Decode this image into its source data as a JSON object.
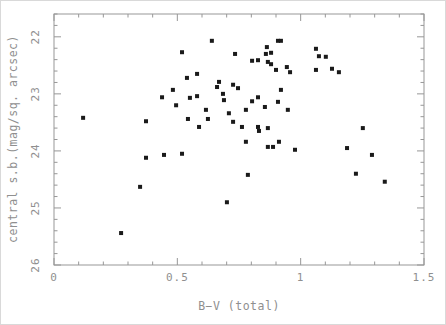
{
  "chart_data": {
    "type": "scatter",
    "title": "",
    "xlabel": "B−V (total)",
    "ylabel": "central s.b.(mag/sq. arcsec)",
    "xlim": [
      0,
      1.5
    ],
    "ylim": [
      21.6,
      26
    ],
    "y_inverted": true,
    "x_major_ticks": [
      0,
      0.5,
      1,
      1.5
    ],
    "x_tick_labels": [
      "0",
      "0.5",
      "1",
      "1.5"
    ],
    "x_minor_step": 0.1,
    "y_major_ticks": [
      22,
      23,
      24,
      25,
      26
    ],
    "y_tick_labels": [
      "22",
      "23",
      "24",
      "25",
      "26"
    ],
    "y_minor_step": 0.2,
    "grid": false,
    "legend": null,
    "marker": "filled-square",
    "marker_color": "#1a1a1a",
    "axis_color": "#979797",
    "label_color": "#8f8f8f",
    "points": [
      [
        0.64,
        22.07
      ],
      [
        0.519,
        22.27
      ],
      [
        0.734,
        22.3
      ],
      [
        0.58,
        22.65
      ],
      [
        0.539,
        22.72
      ],
      [
        0.669,
        22.79
      ],
      [
        0.726,
        22.84
      ],
      [
        0.661,
        22.88
      ],
      [
        0.746,
        22.9
      ],
      [
        0.685,
        23.0
      ],
      [
        0.438,
        23.06
      ],
      [
        0.482,
        22.93
      ],
      [
        0.551,
        23.07
      ],
      [
        0.58,
        23.04
      ],
      [
        0.495,
        23.2
      ],
      [
        0.689,
        23.11
      ],
      [
        0.616,
        23.28
      ],
      [
        0.118,
        23.42
      ],
      [
        0.373,
        23.48
      ],
      [
        0.624,
        23.44
      ],
      [
        0.543,
        23.44
      ],
      [
        0.709,
        23.34
      ],
      [
        0.588,
        23.58
      ],
      [
        0.726,
        23.49
      ],
      [
        0.373,
        24.12
      ],
      [
        0.446,
        24.07
      ],
      [
        0.519,
        24.05
      ],
      [
        0.349,
        24.63
      ],
      [
        0.701,
        24.9
      ],
      [
        0.272,
        25.44
      ],
      [
        0.908,
        22.07
      ],
      [
        0.92,
        22.07
      ],
      [
        0.863,
        22.18
      ],
      [
        0.859,
        22.3
      ],
      [
        0.88,
        22.28
      ],
      [
        0.803,
        22.42
      ],
      [
        0.827,
        22.41
      ],
      [
        0.867,
        22.44
      ],
      [
        0.88,
        22.48
      ],
      [
        0.9,
        22.58
      ],
      [
        0.944,
        22.53
      ],
      [
        0.957,
        22.62
      ],
      [
        1.062,
        22.21
      ],
      [
        1.074,
        22.34
      ],
      [
        1.102,
        22.35
      ],
      [
        1.062,
        22.58
      ],
      [
        1.127,
        22.56
      ],
      [
        1.155,
        22.62
      ],
      [
        0.92,
        22.93
      ],
      [
        0.803,
        23.13
      ],
      [
        0.827,
        23.06
      ],
      [
        0.778,
        23.28
      ],
      [
        0.855,
        23.23
      ],
      [
        0.908,
        23.14
      ],
      [
        0.948,
        23.28
      ],
      [
        0.762,
        23.58
      ],
      [
        0.827,
        23.58
      ],
      [
        0.831,
        23.65
      ],
      [
        0.867,
        23.6
      ],
      [
        0.778,
        23.84
      ],
      [
        0.912,
        23.84
      ],
      [
        0.867,
        23.93
      ],
      [
        0.888,
        23.93
      ],
      [
        0.977,
        23.98
      ],
      [
        1.252,
        23.6
      ],
      [
        1.188,
        23.95
      ],
      [
        1.289,
        24.07
      ],
      [
        0.786,
        24.42
      ],
      [
        1.224,
        24.4
      ],
      [
        1.341,
        24.54
      ]
    ]
  }
}
